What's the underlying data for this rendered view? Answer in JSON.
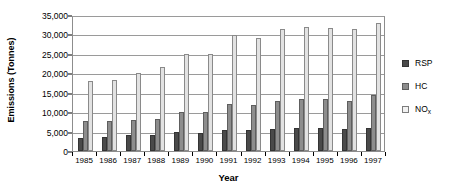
{
  "chart_data": {
    "type": "bar",
    "title": "",
    "xlabel": "Year",
    "ylabel": "Emissions (Tonnes)",
    "ylim": [
      0,
      35000
    ],
    "ytick_labels": [
      "0",
      "5,000",
      "10,000",
      "15,000",
      "20,000",
      "25,000",
      "30,000",
      "35,000"
    ],
    "ytick_values": [
      0,
      5000,
      10000,
      15000,
      20000,
      25000,
      30000,
      35000
    ],
    "grid": true,
    "legend_position": "right",
    "categories": [
      "1985",
      "1986",
      "1987",
      "1988",
      "1989",
      "1990",
      "1991",
      "1992",
      "1993",
      "1994",
      "1995",
      "1996",
      "1997"
    ],
    "series": [
      {
        "name": "RSP",
        "color": "#4a4a4a",
        "values": [
          3400,
          3500,
          4000,
          4100,
          4800,
          4700,
          5400,
          5400,
          5700,
          5800,
          5800,
          5600,
          5800
        ]
      },
      {
        "name": "HC",
        "color": "#8d8d8d",
        "values": [
          7600,
          7700,
          8000,
          8300,
          10000,
          10000,
          12100,
          11800,
          12800,
          13500,
          13400,
          13000,
          14300
        ]
      },
      {
        "name": "NOx",
        "color": "#e2e2e2",
        "values": [
          18000,
          18300,
          20000,
          21500,
          25000,
          25000,
          29900,
          29000,
          31500,
          32000,
          31700,
          31500,
          33000
        ]
      }
    ],
    "legend_entries": [
      {
        "label": "RSP",
        "sub": "",
        "key": "rsp"
      },
      {
        "label": "HC",
        "sub": "",
        "key": "hc"
      },
      {
        "label": "NO",
        "sub": "x",
        "key": "nox"
      }
    ]
  }
}
